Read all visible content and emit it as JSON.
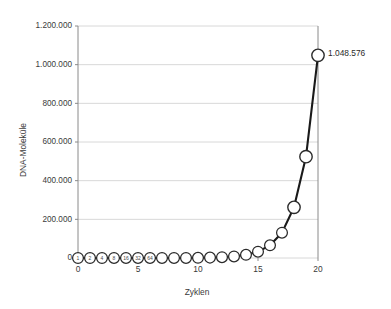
{
  "chart_data": {
    "type": "line",
    "title": "",
    "xlabel": "Zyklen",
    "ylabel": "DNA-Moleküle",
    "xlim": [
      0,
      20
    ],
    "ylim": [
      0,
      1200000
    ],
    "grid": true,
    "legend": null,
    "x": [
      0,
      1,
      2,
      3,
      4,
      5,
      6,
      7,
      8,
      9,
      10,
      11,
      12,
      13,
      14,
      15,
      16,
      17,
      18,
      19,
      20
    ],
    "values": [
      1,
      2,
      4,
      8,
      16,
      32,
      64,
      128,
      256,
      512,
      1024,
      2048,
      4096,
      8192,
      16384,
      32768,
      65536,
      131072,
      262144,
      524288,
      1048576
    ],
    "xticks": [
      "0",
      "5",
      "10",
      "15",
      "20"
    ],
    "xtick_values": [
      0,
      5,
      10,
      15,
      20
    ],
    "yticks": [
      "0",
      "200.000",
      "400.000",
      "600.000",
      "800.000",
      "1.000.000",
      "1.200.000"
    ],
    "ytick_values": [
      0,
      200000,
      400000,
      600000,
      800000,
      1000000,
      1200000
    ],
    "marker_labels": [
      "1",
      "2",
      "4",
      "8",
      "16",
      "32",
      "64",
      "",
      "",
      "",
      "",
      "",
      "",
      "",
      "",
      "",
      "",
      "",
      "",
      "",
      ""
    ],
    "annotations": [
      {
        "label": "1.048.576",
        "x": 20,
        "y": 1048576
      }
    ],
    "series_color": "#1a1a1a",
    "marker_fill": "#ffffff",
    "grid_color": "#d8d8d8",
    "axis_color": "#8a8a8a"
  }
}
